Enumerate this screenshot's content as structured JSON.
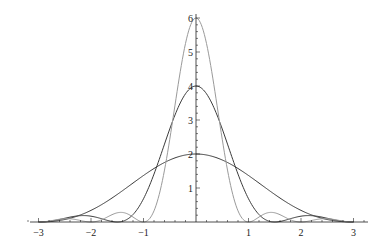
{
  "chart_data": {
    "type": "line",
    "title": "",
    "xlabel": "",
    "ylabel": "",
    "xlim": [
      -3.2,
      3.2
    ],
    "ylim": [
      0,
      6.1
    ],
    "grid": false,
    "legend": null,
    "x_ticks": [
      -3,
      -2,
      -1,
      1,
      2,
      3
    ],
    "x_tick_labels": [
      "−3",
      "−2",
      "−1",
      "1",
      "2",
      "3"
    ],
    "y_ticks": [
      1,
      2,
      3,
      4,
      5,
      6
    ],
    "y_tick_labels": [
      "1",
      "2",
      "3",
      "4",
      "5",
      "6"
    ],
    "minor_tick_step": 0.2,
    "series": [
      {
        "name": "peak 2 (zero at ±3)",
        "formula": "2*sinc^2(x/3)",
        "amplitude": 2,
        "width": 3,
        "color": "#3a3a3a",
        "x": [
          -3,
          -2,
          -1,
          0,
          1,
          2,
          3
        ],
        "values": [
          0,
          0.34,
          1.37,
          2,
          1.37,
          0.34,
          0
        ]
      },
      {
        "name": "peak 4 (zeros at ±1.5, ±3)",
        "formula": "4*sinc^2(2x/3)",
        "amplitude": 4,
        "width": 1.5,
        "color": "#3a3a3a",
        "x": [
          -3,
          -2.25,
          -1.5,
          -1,
          -0.5,
          0,
          0.5,
          1,
          1.5,
          2.25,
          3
        ],
        "values": [
          0,
          0.18,
          0,
          0.68,
          2.74,
          4,
          2.74,
          0.68,
          0,
          0.18,
          0
        ]
      },
      {
        "name": "peak 6 (zeros at integers)",
        "formula": "6*sinc^2(x)",
        "amplitude": 6,
        "width": 1,
        "color": "#9a9a9a",
        "x": [
          -3,
          -2.5,
          -2,
          -1.5,
          -1,
          -0.5,
          0,
          0.5,
          1,
          1.5,
          2,
          2.5,
          3
        ],
        "values": [
          0,
          0.1,
          0,
          0.27,
          0,
          2.43,
          6,
          2.43,
          0,
          0.27,
          0,
          0.1,
          0
        ]
      }
    ]
  }
}
